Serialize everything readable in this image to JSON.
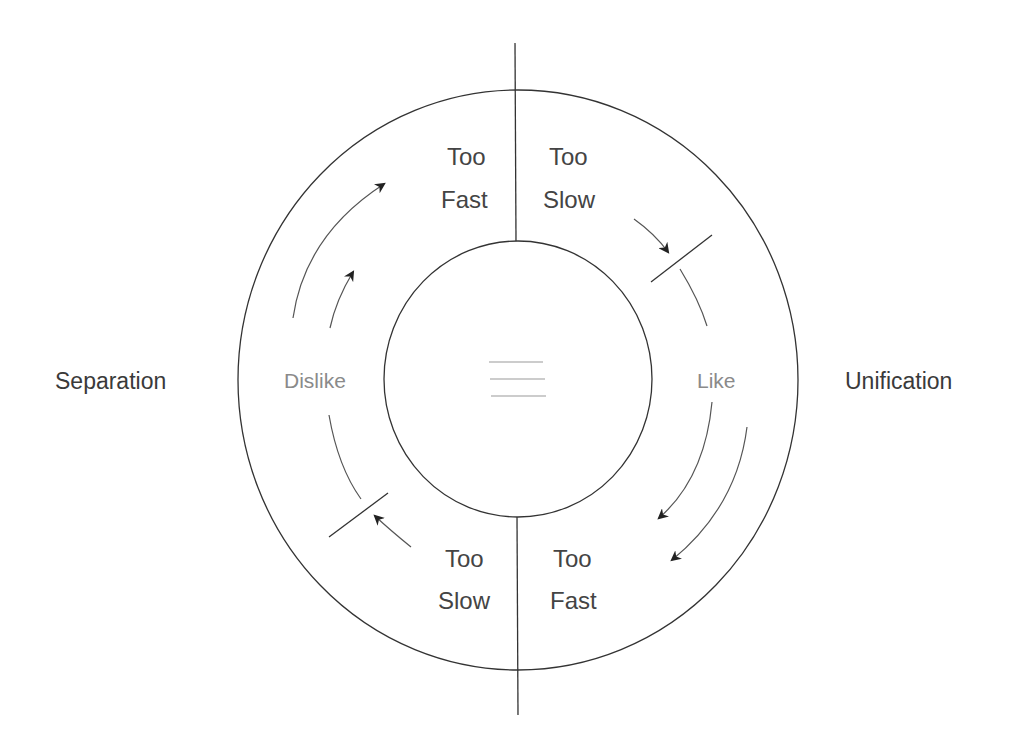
{
  "diagram": {
    "type": "cyclic relationship diagram",
    "side_labels": {
      "left": "Separation",
      "right": "Unification"
    },
    "ring_labels": {
      "dislike": "Dislike",
      "like": "Like"
    },
    "quadrants": {
      "top_left": {
        "line1": "Too",
        "line2": "Fast"
      },
      "top_right": {
        "line1": "Too",
        "line2": "Slow"
      },
      "bottom_left": {
        "line1": "Too",
        "line2": "Slow"
      },
      "bottom_right": {
        "line1": "Too",
        "line2": "Fast"
      }
    },
    "center_icon": "three-horizontal-lines",
    "colors": {
      "stroke": "#333333",
      "text": "#444444",
      "faint_text": "#8a8a8a",
      "background": "#ffffff"
    }
  }
}
